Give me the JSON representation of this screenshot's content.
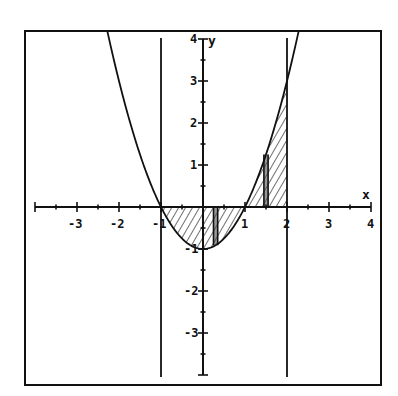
{
  "chart_data": {
    "type": "line",
    "title": "",
    "function": "y = x^2 - 1",
    "xlabel": "x",
    "ylabel": "y",
    "xlim": [
      -4,
      4
    ],
    "ylim": [
      -4,
      4
    ],
    "x_ticks": [
      -3,
      -2,
      -1,
      1,
      2,
      3,
      4
    ],
    "x_tick_labels": [
      "-3",
      "-2",
      "-1",
      "1",
      "2",
      "3",
      "4"
    ],
    "y_ticks": [
      4,
      3,
      2,
      1,
      -1,
      -2,
      -3
    ],
    "y_tick_labels": [
      "4",
      "3",
      "2",
      "1",
      "-1",
      "-2",
      "-3"
    ],
    "minor_tick_step": 0.5,
    "vertical_lines": [
      -1,
      2
    ],
    "shaded_region": {
      "from": -1,
      "to": 2,
      "between": "curve and x-axis",
      "style": "hatched"
    },
    "highlighted_strips": [
      0.3,
      1.5
    ],
    "series": [
      {
        "name": "parabola",
        "x": [
          -2.1,
          -2,
          -1.5,
          -1,
          -0.5,
          0,
          0.5,
          1,
          1.5,
          2,
          2.15
        ],
        "values": [
          3.41,
          3,
          1.25,
          0,
          -0.75,
          -1,
          -0.75,
          0,
          1.25,
          3,
          3.62
        ]
      }
    ],
    "grid": false,
    "legend": null
  },
  "labels": {
    "x_axis": "x",
    "y_axis": "y"
  },
  "colors": {
    "ink": "#111111",
    "background": "#ffffff"
  }
}
